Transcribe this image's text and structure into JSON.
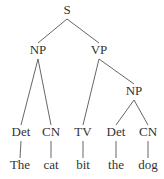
{
  "diagram": {
    "type": "parse-tree",
    "nodes": [
      {
        "id": "s",
        "label": "S",
        "x": 67,
        "y": 14
      },
      {
        "id": "np1",
        "label": "NP",
        "x": 38,
        "y": 54
      },
      {
        "id": "vp",
        "label": "VP",
        "x": 99,
        "y": 54
      },
      {
        "id": "np2",
        "label": "NP",
        "x": 134,
        "y": 95
      },
      {
        "id": "det1",
        "label": "Det",
        "x": 21,
        "y": 136
      },
      {
        "id": "cn1",
        "label": "CN",
        "x": 51,
        "y": 136
      },
      {
        "id": "tv",
        "label": "TV",
        "x": 83,
        "y": 136
      },
      {
        "id": "det2",
        "label": "Det",
        "x": 116,
        "y": 136
      },
      {
        "id": "cn2",
        "label": "CN",
        "x": 148,
        "y": 136
      },
      {
        "id": "w1",
        "label": "The",
        "x": 20,
        "y": 169
      },
      {
        "id": "w2",
        "label": "cat",
        "x": 51,
        "y": 169
      },
      {
        "id": "w3",
        "label": "bit",
        "x": 83,
        "y": 169
      },
      {
        "id": "w4",
        "label": "the",
        "x": 116,
        "y": 169
      },
      {
        "id": "w5",
        "label": "dog",
        "x": 148,
        "y": 169
      }
    ],
    "edges": [
      {
        "from": "s",
        "to": "np1"
      },
      {
        "from": "s",
        "to": "vp"
      },
      {
        "from": "np1",
        "to": "det1"
      },
      {
        "from": "np1",
        "to": "cn1"
      },
      {
        "from": "vp",
        "to": "tv"
      },
      {
        "from": "vp",
        "to": "np2"
      },
      {
        "from": "np2",
        "to": "det2"
      },
      {
        "from": "np2",
        "to": "cn2"
      },
      {
        "from": "det1",
        "to": "w1"
      },
      {
        "from": "cn1",
        "to": "w2"
      },
      {
        "from": "tv",
        "to": "w3"
      },
      {
        "from": "det2",
        "to": "w4"
      },
      {
        "from": "cn2",
        "to": "w5"
      }
    ]
  }
}
